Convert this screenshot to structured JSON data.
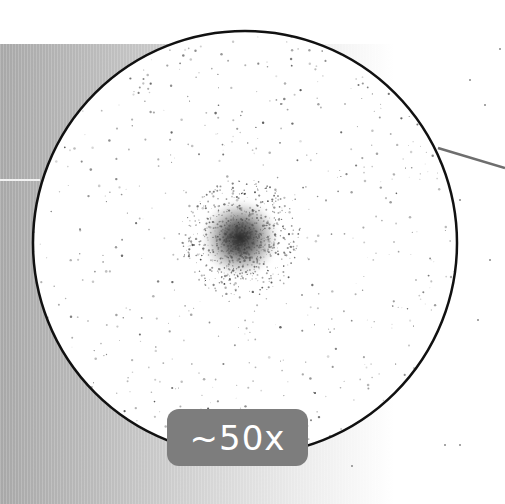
{
  "image": {
    "description": "Magnified circular view of a globular star cluster with a pointer line",
    "magnification_label": "~50x",
    "colors": {
      "background": "#ffffff",
      "circle_stroke": "#111111",
      "badge_bg": "#7d7d7d",
      "badge_text": "#ffffff",
      "pointer_line": "#6e6e6e",
      "gradient_dark": "#a8a8a8"
    }
  }
}
